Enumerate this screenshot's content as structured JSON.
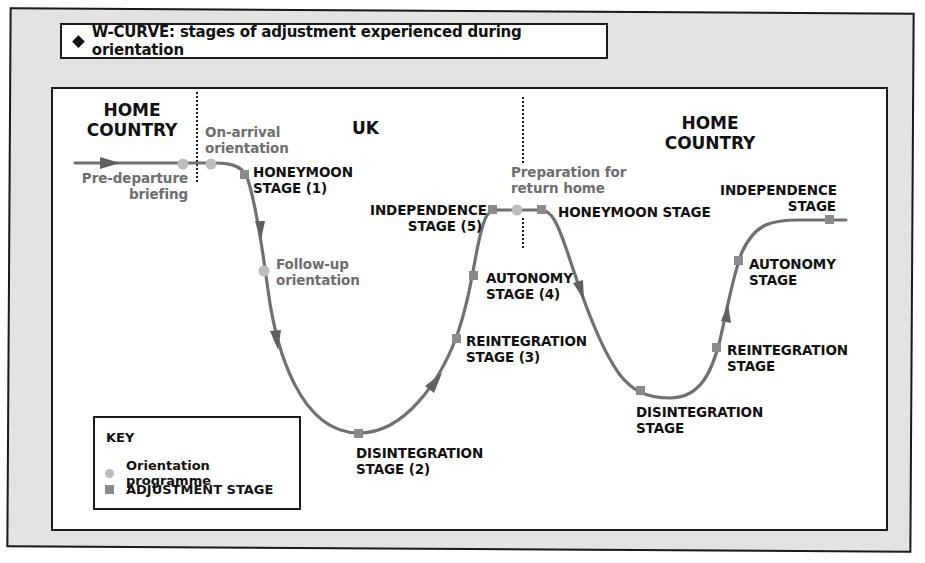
{
  "title": "W-CURVE: stages of adjustment experienced during orientation",
  "colors": {
    "panel_background": "#e3e3e3",
    "border": "#1a1a1a",
    "curve": "#707070",
    "orientation_marker": "#bdbdbd",
    "adjustment_marker": "#8a8a8a",
    "orientation_text": "#6e6e6e",
    "stage_text": "#111111"
  },
  "regions": [
    {
      "label": "HOME\nCOUNTRY"
    },
    {
      "label": "UK"
    },
    {
      "label": "HOME\nCOUNTRY"
    }
  ],
  "orientation_programme": [
    {
      "label": "Pre-departure\nbriefing"
    },
    {
      "label": "On-arrival\norientation"
    },
    {
      "label": "Follow-up\norientation"
    },
    {
      "label": "Preparation for\nreturn home"
    }
  ],
  "adjustment_stages": [
    {
      "label": "HONEYMOON\nSTAGE (1)"
    },
    {
      "label": "DISINTEGRATION\nSTAGE (2)"
    },
    {
      "label": "REINTEGRATION\nSTAGE (3)"
    },
    {
      "label": "AUTONOMY\nSTAGE (4)"
    },
    {
      "label": "INDEPENDENCE\nSTAGE (5)"
    },
    {
      "label": "HONEYMOON STAGE"
    },
    {
      "label": "DISINTEGRATION\nSTAGE"
    },
    {
      "label": "REINTEGRATION\nSTAGE"
    },
    {
      "label": "AUTONOMY\nSTAGE"
    },
    {
      "label": "INDEPENDENCE\nSTAGE"
    }
  ],
  "key": {
    "title": "KEY",
    "items": [
      {
        "marker": "circle",
        "label": "Orientation programme"
      },
      {
        "marker": "square",
        "label": "ADJUSTMENT STAGE"
      }
    ]
  }
}
